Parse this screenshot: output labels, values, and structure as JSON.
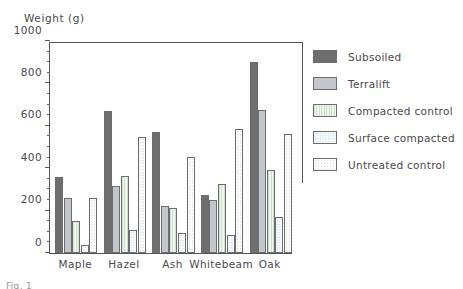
{
  "chart_data": {
    "type": "bar",
    "title": "",
    "ylabel": "Weight (g)",
    "xlabel": "",
    "ylim": [
      0,
      1000
    ],
    "ytick_labels": [
      "0",
      "200",
      "400",
      "600",
      "800",
      "1000"
    ],
    "ytick_values": [
      0,
      200,
      400,
      600,
      800,
      1000
    ],
    "minor_tick_interval": 50,
    "grid": false,
    "legend_position": "right",
    "categories": [
      "Maple",
      "Hazel",
      "Ash",
      "Whitebeam",
      "Oak"
    ],
    "series": [
      {
        "name": "Subsoiled",
        "color": "#6e6e6e",
        "pattern": "solid-dark-gray",
        "values": [
          360,
          670,
          570,
          275,
          900
        ]
      },
      {
        "name": "Terralift",
        "color": "#c3c7cc",
        "pattern": "solid-light-gray",
        "values": [
          260,
          315,
          220,
          250,
          675
        ]
      },
      {
        "name": "Compacted control",
        "color": "#f2f6f1",
        "pattern": "vertical-green-hatch",
        "values": [
          150,
          365,
          210,
          325,
          390
        ]
      },
      {
        "name": "Surface compacted",
        "color": "#f7fafc",
        "pattern": "blue-dotted",
        "values": [
          40,
          110,
          95,
          85,
          170
        ]
      },
      {
        "name": "Untreated control",
        "color": "#fdfdfd",
        "pattern": "faint-dotted",
        "values": [
          260,
          545,
          455,
          585,
          560
        ]
      }
    ]
  },
  "axis": {
    "y_title": "Weight (g)"
  },
  "legend": {
    "entries": [
      {
        "label": "Subsoiled"
      },
      {
        "label": "Terralift"
      },
      {
        "label": "Compacted control"
      },
      {
        "label": "Surface compacted"
      },
      {
        "label": "Untreated control"
      }
    ]
  },
  "caption": {
    "text": "Fig. 1"
  }
}
